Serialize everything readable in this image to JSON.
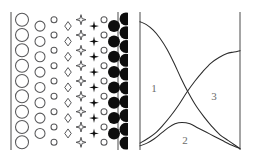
{
  "figure": {
    "background_color": "#ffffff",
    "width": 256,
    "height": 161
  },
  "panels": [
    {
      "id": "morphology-gradient-panel",
      "name": "left-panel",
      "description": "Shape gradient array: open circles grade into open diamonds, then filled four-pointed stars, then filled circles",
      "frame": {
        "left_rule_x": 11,
        "right_rule_x": 118,
        "top_y": 12,
        "bottom_y": 150,
        "stroke_color": "#4a4a4a"
      },
      "columns": [
        {
          "index": 0,
          "shape": "circle-open",
          "fill": "none",
          "stroke": "#58585a",
          "size": 13,
          "x": 22,
          "count": 9,
          "offset": 0
        },
        {
          "index": 1,
          "shape": "circle-open",
          "fill": "none",
          "stroke": "#58585a",
          "size": 10,
          "x": 40,
          "count": 9,
          "offset": 1
        },
        {
          "index": 2,
          "shape": "circle-open",
          "fill": "none",
          "stroke": "#58585a",
          "size": 6,
          "x": 54,
          "count": 9,
          "offset": 0
        },
        {
          "index": 3,
          "shape": "diamond-open",
          "fill": "#ffffff",
          "stroke": "#58585a",
          "size": 9,
          "x": 68,
          "count": 9,
          "offset": 1
        },
        {
          "index": 4,
          "shape": "star4-open",
          "fill": "#ffffff",
          "stroke": "#58585a",
          "size": 10,
          "x": 81,
          "count": 9,
          "offset": 0
        },
        {
          "index": 5,
          "shape": "star4-filled",
          "fill": "#0d0d0d",
          "stroke": "none",
          "size": 10,
          "x": 94,
          "count": 9,
          "offset": 1
        },
        {
          "index": 6,
          "shape": "circle-open",
          "fill": "none",
          "stroke": "#58585a",
          "size": 6,
          "x": 104,
          "count": 9,
          "offset": 0
        },
        {
          "index": 7,
          "shape": "circle-filled",
          "fill": "#0d0d0d",
          "stroke": "none",
          "size": 12,
          "x": 114,
          "count": 9,
          "offset": 1
        },
        {
          "index": 8,
          "shape": "circle-filled",
          "fill": "#0d0d0d",
          "stroke": "none",
          "size": 13,
          "x": 126,
          "count": 10,
          "offset": 0
        }
      ]
    },
    {
      "id": "regime-curves-panel",
      "name": "right-panel",
      "description": "Three crossing curves partitioning the plot into regions labelled 1, 2 and 3",
      "frame": {
        "left_rule_x": 12,
        "right_rule_x": 112,
        "top_y": 12,
        "bottom_y": 150,
        "stroke_color": "#4a4a4a"
      },
      "labels": [
        {
          "text": "1",
          "x": 26,
          "y": 92,
          "color": "#6b6b6b"
        },
        {
          "text": "2",
          "x": 57,
          "y": 144,
          "color": "#6b6b6b"
        },
        {
          "text": "3",
          "x": 86,
          "y": 100,
          "color": "#6b6b6b"
        }
      ]
    }
  ],
  "chart_data": {
    "type": "line",
    "title": "",
    "subtitle": "",
    "xlabel": "",
    "ylabel": "",
    "xlim": [
      0,
      1
    ],
    "ylim": [
      0,
      1
    ],
    "grid": false,
    "legend": "none",
    "tick_labels": {
      "x": [],
      "y": []
    },
    "annotations": [
      {
        "text": "1",
        "x": 0.14,
        "y": 0.42,
        "region": "upper-left region bounded by descending curve"
      },
      {
        "text": "2",
        "x": 0.45,
        "y": 0.04,
        "region": "lower-middle lens between the two low curves"
      },
      {
        "text": "3",
        "x": 0.74,
        "y": 0.36,
        "region": "right region under the ascending curve"
      }
    ],
    "series": [
      {
        "name": "descending-curve",
        "comment": "Starts high at the left frame, falls steeply with an inflection, crosses the rising curve near x=0.45, ends at the bottom-right corner.",
        "x": [
          0.0,
          0.06,
          0.13,
          0.2,
          0.27,
          0.34,
          0.41,
          0.48,
          0.56,
          0.64,
          0.72,
          0.8,
          0.88,
          0.94,
          1.0
        ],
        "y": [
          0.93,
          0.91,
          0.87,
          0.81,
          0.73,
          0.63,
          0.52,
          0.42,
          0.32,
          0.24,
          0.17,
          0.11,
          0.07,
          0.04,
          0.01
        ]
      },
      {
        "name": "rising-curve",
        "comment": "Starts at the bottom-left frame, rises through the crossing point near x=0.45 and continues up to the right frame at about y=0.72.",
        "x": [
          0.0,
          0.07,
          0.15,
          0.23,
          0.31,
          0.39,
          0.47,
          0.55,
          0.63,
          0.71,
          0.79,
          0.87,
          0.94,
          1.0
        ],
        "y": [
          0.05,
          0.08,
          0.12,
          0.18,
          0.25,
          0.33,
          0.42,
          0.5,
          0.57,
          0.63,
          0.67,
          0.7,
          0.71,
          0.72
        ]
      },
      {
        "name": "humped-curve",
        "comment": "Starts just below the rising curve at the bottom-left, swells to a low rounded maximum near x=0.42, then decays to the bottom-right corner.",
        "x": [
          0.0,
          0.07,
          0.14,
          0.21,
          0.28,
          0.35,
          0.42,
          0.5,
          0.58,
          0.66,
          0.74,
          0.82,
          0.9,
          1.0
        ],
        "y": [
          0.03,
          0.05,
          0.08,
          0.12,
          0.16,
          0.19,
          0.2,
          0.19,
          0.16,
          0.13,
          0.1,
          0.07,
          0.04,
          0.01
        ]
      }
    ]
  }
}
